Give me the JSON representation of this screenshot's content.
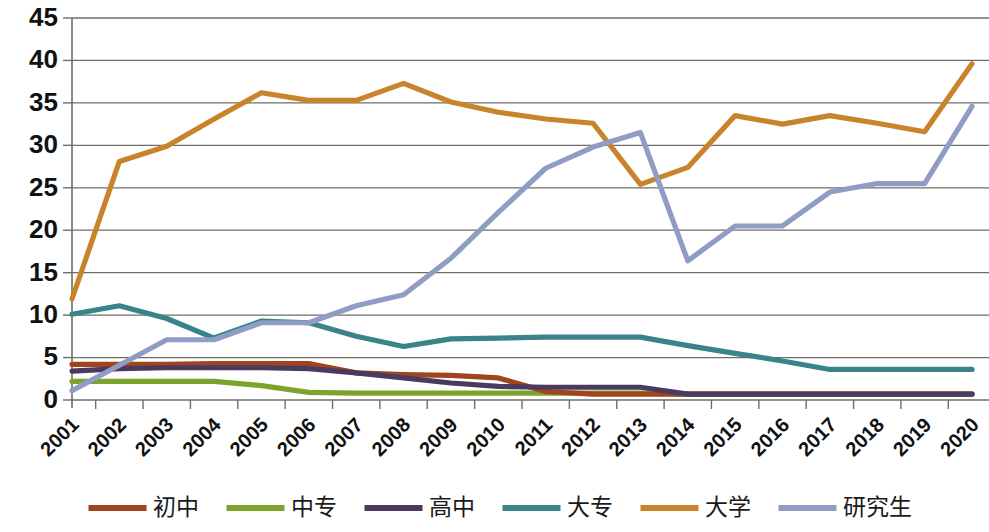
{
  "chart_data": {
    "type": "line",
    "title": "",
    "subtitle": "",
    "xlabel": "",
    "ylabel": "",
    "xlim": [
      2001,
      2020
    ],
    "ylim": [
      0,
      45
    ],
    "y_ticks": [
      0,
      5,
      10,
      15,
      20,
      25,
      30,
      35,
      40,
      45
    ],
    "grid": "horizontal",
    "legend_position": "bottom",
    "categories": [
      "2001",
      "2002",
      "2003",
      "2004",
      "2005",
      "2006",
      "2007",
      "2008",
      "2009",
      "2010",
      "2011",
      "2012",
      "2013",
      "2014",
      "2015",
      "2016",
      "2017",
      "2018",
      "2019",
      "2020"
    ],
    "series": [
      {
        "name": "初中",
        "color": "#a0441d",
        "values": [
          4.2,
          4.2,
          4.2,
          4.3,
          4.3,
          4.3,
          3.2,
          3.0,
          2.9,
          2.6,
          1.0,
          0.7,
          0.7,
          0.7,
          0.7,
          0.7,
          0.7,
          0.7,
          0.7,
          0.7
        ]
      },
      {
        "name": "中专",
        "color": "#7aa42c",
        "values": [
          2.2,
          2.2,
          2.2,
          2.2,
          1.7,
          0.9,
          0.8,
          0.8,
          0.8,
          0.8,
          0.8,
          0.8,
          0.8,
          0.7,
          0.7,
          0.7,
          0.7,
          0.7,
          0.7,
          0.7
        ]
      },
      {
        "name": "高中",
        "color": "#4a3a5e",
        "values": [
          3.4,
          3.7,
          3.8,
          3.8,
          3.8,
          3.7,
          3.2,
          2.6,
          2.0,
          1.6,
          1.5,
          1.5,
          1.5,
          0.7,
          0.7,
          0.7,
          0.7,
          0.7,
          0.7,
          0.7
        ]
      },
      {
        "name": "大专",
        "color": "#3a8489"
      },
      {
        "name": "大学",
        "color": "#c9832b"
      },
      {
        "name": "研究生",
        "color": "#8f9cc4"
      }
    ],
    "series_values": {
      "初中": [
        4.2,
        4.2,
        4.2,
        4.3,
        4.3,
        4.3,
        3.2,
        3.0,
        2.9,
        2.6,
        1.0,
        0.7,
        0.7,
        0.7,
        0.7,
        0.7,
        0.7,
        0.7,
        0.7,
        0.7
      ],
      "中专": [
        2.2,
        2.2,
        2.2,
        2.2,
        1.7,
        0.9,
        0.8,
        0.8,
        0.8,
        0.8,
        0.8,
        0.8,
        0.8,
        0.7,
        0.7,
        0.7,
        0.7,
        0.7,
        0.7,
        0.7
      ],
      "高中": [
        3.4,
        3.7,
        3.8,
        3.8,
        3.8,
        3.7,
        3.2,
        2.6,
        2.0,
        1.6,
        1.5,
        1.5,
        1.5,
        0.7,
        0.7,
        0.7,
        0.7,
        0.7,
        0.7,
        0.7
      ],
      "大专": [
        10.1,
        11.1,
        9.6,
        7.3,
        9.3,
        9.1,
        7.5,
        6.3,
        7.2,
        7.3,
        7.4,
        7.4,
        7.4,
        6.4,
        5.5,
        4.6,
        3.6,
        3.6,
        3.6,
        3.6
      ],
      "大学": [
        11.9,
        28.1,
        29.9,
        33.1,
        36.2,
        35.3,
        35.3,
        37.3,
        35.1,
        33.9,
        33.1,
        32.6,
        25.4,
        27.4,
        33.5,
        32.5,
        33.5,
        32.6,
        31.6,
        39.6
      ],
      "研究生": [
        1.1,
        4.1,
        7.1,
        7.1,
        9.1,
        9.1,
        11.1,
        12.4,
        16.7,
        22.1,
        27.3,
        29.8,
        31.5,
        16.4,
        20.5,
        20.5,
        24.5,
        25.5,
        25.5,
        34.6
      ]
    }
  },
  "legend": {
    "items": [
      {
        "label": "初中",
        "color": "#a0441d"
      },
      {
        "label": "中专",
        "color": "#7aa42c"
      },
      {
        "label": "高中",
        "color": "#4a3a5e"
      },
      {
        "label": "大专",
        "color": "#3a8489"
      },
      {
        "label": "大学",
        "color": "#c9832b"
      },
      {
        "label": "研究生",
        "color": "#8f9cc4"
      }
    ]
  },
  "axes": {
    "y_tick_labels": [
      "45",
      "40",
      "35",
      "30",
      "25",
      "20",
      "15",
      "10",
      "5",
      "0"
    ],
    "x_tick_labels": [
      "2001",
      "2002",
      "2003",
      "2004",
      "2005",
      "2006",
      "2007",
      "2008",
      "2009",
      "2010",
      "2011",
      "2012",
      "2013",
      "2014",
      "2015",
      "2016",
      "2017",
      "2018",
      "2019",
      "2020"
    ]
  }
}
